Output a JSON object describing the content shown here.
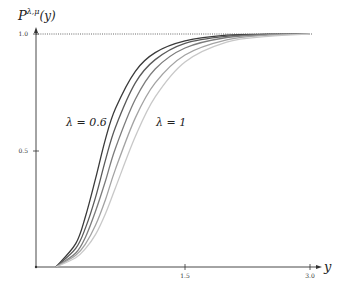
{
  "chart_data": {
    "type": "line",
    "title": "",
    "ylabel": "P^{λ,μ}(y)",
    "ylabel_display": {
      "base": "P",
      "sup": "λ,μ",
      "arg": "(y)"
    },
    "xlabel": "y",
    "xlim": [
      0,
      3.0
    ],
    "ylim": [
      0,
      1.0
    ],
    "x_ticks": [
      {
        "value": 1.5,
        "label": "1.5"
      },
      {
        "value": 3.0,
        "label": "3.0"
      }
    ],
    "y_ticks": [
      {
        "value": 0.5,
        "label": "0.5"
      },
      {
        "value": 1.0,
        "label": "1.0"
      }
    ],
    "reference_line": {
      "y": 1.0,
      "style": "dotted"
    },
    "grid": false,
    "annotations": [
      {
        "text": "λ = 0.6",
        "near_series": 0
      },
      {
        "text": "λ = 1",
        "near_series": 4
      }
    ],
    "series": [
      {
        "name": "λ = 0.6",
        "color": "#3a3a3a",
        "x": [
          0.2,
          0.4,
          0.5,
          0.6,
          0.7,
          0.8,
          1.0,
          1.2,
          1.5,
          2.0,
          2.5,
          3.0
        ],
        "values": [
          0.0,
          0.1,
          0.22,
          0.38,
          0.55,
          0.68,
          0.84,
          0.92,
          0.97,
          0.995,
          0.999,
          1.0
        ]
      },
      {
        "name": "λ = 0.7",
        "color": "#5a5a5a",
        "x": [
          0.2,
          0.4,
          0.5,
          0.6,
          0.7,
          0.8,
          1.0,
          1.2,
          1.5,
          2.0,
          2.5,
          3.0
        ],
        "values": [
          0.0,
          0.08,
          0.17,
          0.3,
          0.46,
          0.6,
          0.79,
          0.89,
          0.96,
          0.99,
          0.998,
          1.0
        ]
      },
      {
        "name": "λ = 0.8",
        "color": "#7c7c7c",
        "x": [
          0.2,
          0.4,
          0.5,
          0.6,
          0.7,
          0.8,
          1.0,
          1.2,
          1.5,
          2.0,
          2.5,
          3.0
        ],
        "values": [
          0.0,
          0.06,
          0.13,
          0.24,
          0.37,
          0.51,
          0.72,
          0.85,
          0.94,
          0.985,
          0.997,
          1.0
        ]
      },
      {
        "name": "λ = 0.9",
        "color": "#a3a3a3",
        "x": [
          0.2,
          0.4,
          0.5,
          0.6,
          0.7,
          0.8,
          1.0,
          1.2,
          1.5,
          2.0,
          2.5,
          3.0
        ],
        "values": [
          0.0,
          0.05,
          0.1,
          0.18,
          0.29,
          0.42,
          0.64,
          0.79,
          0.91,
          0.975,
          0.995,
          1.0
        ]
      },
      {
        "name": "λ = 1",
        "color": "#c8c8c8",
        "x": [
          0.2,
          0.4,
          0.5,
          0.6,
          0.7,
          0.8,
          1.0,
          1.2,
          1.5,
          2.0,
          2.5,
          3.0
        ],
        "values": [
          0.0,
          0.04,
          0.08,
          0.14,
          0.23,
          0.34,
          0.56,
          0.73,
          0.88,
          0.965,
          0.99,
          1.0
        ]
      }
    ]
  }
}
